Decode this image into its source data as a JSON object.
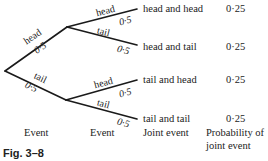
{
  "figure": {
    "caption": "Fig. 3–8",
    "columns": {
      "event1": "Event",
      "event2": "Event",
      "joint": "Joint event",
      "probability_line1": "Probability of",
      "probability_line2": "joint event"
    },
    "first_level": [
      {
        "label": "head",
        "prob": "0·5"
      },
      {
        "label": "tail",
        "prob": "0·5"
      }
    ],
    "second_level": [
      {
        "label": "head",
        "prob": "0·5",
        "joint": "head and head",
        "joint_prob": "0·25"
      },
      {
        "label": "tail",
        "prob": "0·5",
        "joint": "head and tail",
        "joint_prob": "0·25"
      },
      {
        "label": "head",
        "prob": "0·5",
        "joint": "tail and head",
        "joint_prob": "0·25"
      },
      {
        "label": "tail",
        "prob": "0·5",
        "joint": "tail and tail",
        "joint_prob": "0·25"
      }
    ],
    "line_color": "#1a1a1a"
  }
}
